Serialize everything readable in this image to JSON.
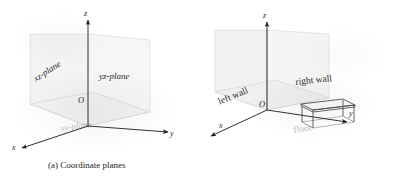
{
  "figure": {
    "kind": "textbook-figure-scan",
    "panels": [
      {
        "id": "a",
        "caption": "(a) Coordinate planes",
        "axes": [
          {
            "name": "z-axis",
            "label": "z"
          },
          {
            "name": "y-axis",
            "label": "y"
          },
          {
            "name": "x-axis",
            "label": "x"
          }
        ],
        "origin_label": "O",
        "labels": {
          "xz_plane": "xz-plane",
          "yz_plane": "yz-plane",
          "xy_plane": "xy-plane"
        }
      },
      {
        "id": "b",
        "caption": "(b)",
        "axes": [
          {
            "name": "z-axis",
            "label": "z"
          },
          {
            "name": "y-axis",
            "label": "y"
          },
          {
            "name": "x-axis",
            "label": "x"
          }
        ],
        "origin_label": "O",
        "labels": {
          "left_wall": "left wall",
          "right_wall": "right wall",
          "floor": "floor"
        },
        "objects": [
          {
            "name": "table",
            "label": ""
          }
        ]
      }
    ],
    "colors": {
      "ink": "#1b1b1b",
      "paper": "#ffffff",
      "faint_ink": "#6f6f6f"
    }
  }
}
